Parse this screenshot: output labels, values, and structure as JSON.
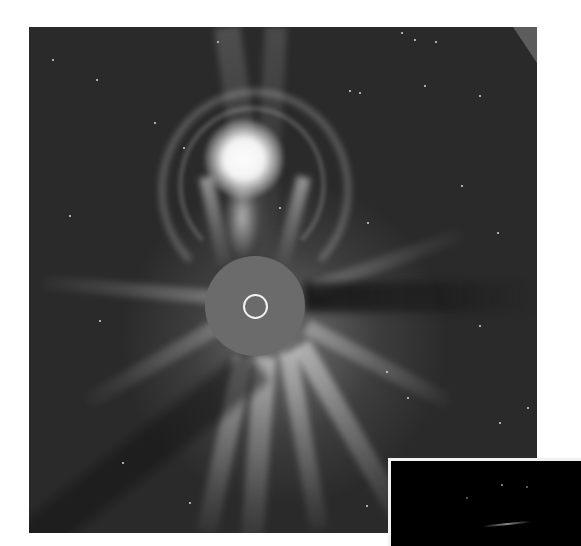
{
  "image": {
    "subject": "coronagraph image of a coronal mass ejection",
    "description": "Grayscale coronagraph frame showing a bright loop-shaped CME erupting upward above a gray occulting disk, with a small white circle marking the solar limb, radial streamers, and background stars.",
    "colors": {
      "background": "#2a2a2a",
      "occulting_disk": "#6b6b6b",
      "sun_outline": "#f2f2f2",
      "cme_core": "#ffffff",
      "page": "#ffffff",
      "inset_background": "#000000"
    },
    "features": {
      "occulting_disk": {
        "cx": 255,
        "cy": 305,
        "r": 50
      },
      "sun_circle": {
        "cx": 256,
        "cy": 305,
        "r": 11
      },
      "cme_core": {
        "cx": 240,
        "cy": 150
      },
      "inset_panel": {
        "x": 388,
        "y": 458
      }
    }
  }
}
